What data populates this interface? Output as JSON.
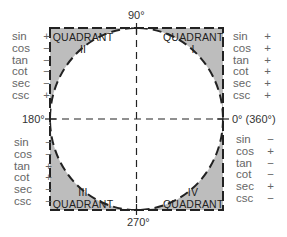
{
  "axes": {
    "top": "90°",
    "left": "180°",
    "right": "0° (360°)",
    "bottom": "270°"
  },
  "quadrants": [
    {
      "id": "I",
      "word": "QUADRANT",
      "numeral": "I",
      "signs": [
        {
          "fn": "sin",
          "s": "+"
        },
        {
          "fn": "cos",
          "s": "+"
        },
        {
          "fn": "tan",
          "s": "+"
        },
        {
          "fn": "cot",
          "s": "+"
        },
        {
          "fn": "sec",
          "s": "+"
        },
        {
          "fn": "csc",
          "s": "+"
        }
      ]
    },
    {
      "id": "II",
      "word": "QUADRANT",
      "numeral": "II",
      "signs": [
        {
          "fn": "sin",
          "s": "+"
        },
        {
          "fn": "cos",
          "s": "−"
        },
        {
          "fn": "tan",
          "s": "−"
        },
        {
          "fn": "cot",
          "s": "−"
        },
        {
          "fn": "sec",
          "s": "−"
        },
        {
          "fn": "csc",
          "s": "+"
        }
      ]
    },
    {
      "id": "III",
      "word": "QUADRANT",
      "numeral": "III",
      "signs": [
        {
          "fn": "sin",
          "s": "−"
        },
        {
          "fn": "cos",
          "s": "−"
        },
        {
          "fn": "tan",
          "s": "+"
        },
        {
          "fn": "cot",
          "s": "+"
        },
        {
          "fn": "sec",
          "s": "−"
        },
        {
          "fn": "csc",
          "s": "−"
        }
      ]
    },
    {
      "id": "IV",
      "word": "QUADRANT",
      "numeral": "IV",
      "signs": [
        {
          "fn": "sin",
          "s": "−"
        },
        {
          "fn": "cos",
          "s": "+"
        },
        {
          "fn": "tan",
          "s": "−"
        },
        {
          "fn": "cot",
          "s": "−"
        },
        {
          "fn": "sec",
          "s": "+"
        },
        {
          "fn": "csc",
          "s": "−"
        }
      ]
    }
  ],
  "colors": {
    "shade": "#bdbdbd",
    "line": "#222222"
  }
}
